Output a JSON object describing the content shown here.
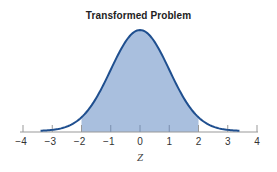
{
  "chart_data": {
    "type": "area",
    "title": "Transformed Problem",
    "xlabel": "Z",
    "ylabel": "",
    "xlim": [
      -4,
      4
    ],
    "x_ticks": [
      -4,
      -3,
      -2,
      -1,
      0,
      1,
      2,
      3,
      4
    ],
    "x_tick_labels": [
      "−4",
      "−3",
      "−2",
      "−1",
      "0",
      "1",
      "2",
      "3",
      "4"
    ],
    "curve": "standard normal density",
    "curve_x_range": [
      -3.4,
      3.4
    ],
    "shaded_region": {
      "from": -2,
      "to": 2
    },
    "grid": false,
    "legend": null,
    "colors": {
      "curve": "#1f4f8f",
      "shade": "#a9bfde",
      "axis": "#999999"
    }
  }
}
